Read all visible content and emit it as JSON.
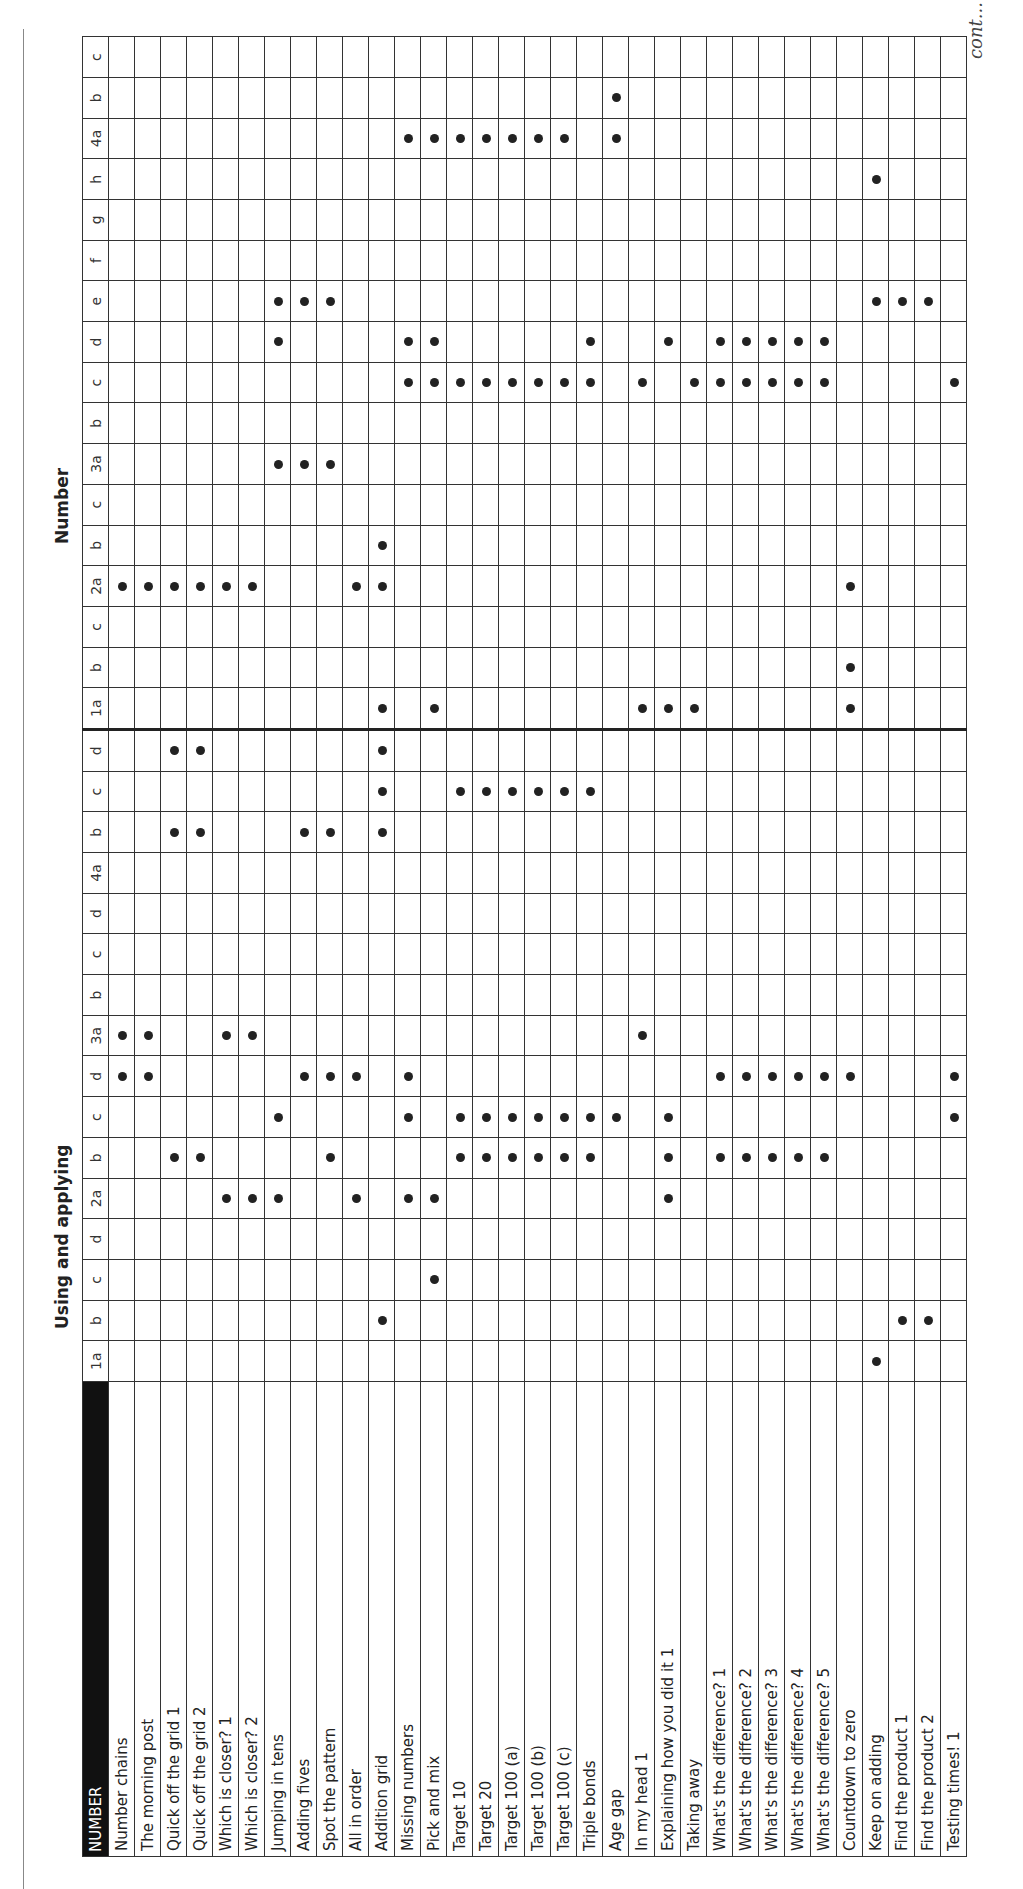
{
  "header": {
    "corner_label": "NUMBER",
    "sections": [
      {
        "title": "Using and applying",
        "criteria": [
          "1a",
          "b",
          "c",
          "d",
          "2a",
          "b",
          "c",
          "d",
          "3a",
          "b",
          "c",
          "d",
          "4a",
          "b",
          "c",
          "d"
        ]
      },
      {
        "title": "Number",
        "criteria": [
          "1a",
          "b",
          "c",
          "2a",
          "b",
          "c",
          "3a",
          "b",
          "c",
          "d",
          "e",
          "f",
          "g",
          "h",
          "4a",
          "b",
          "c"
        ]
      }
    ]
  },
  "footer": {
    "continued": "cont..."
  },
  "activities": [
    "Number chains",
    "The morning post",
    "Quick off the grid 1",
    "Quick off the grid 2",
    "Which is closer? 1",
    "Which is closer? 2",
    "Jumping in tens",
    "Adding fives",
    "Spot the pattern",
    "All in order",
    "Addition grid",
    "Missing numbers",
    "Pick and mix",
    "Target 10",
    "Target 20",
    "Target 100 (a)",
    "Target 100 (b)",
    "Target 100 (c)",
    "Triple bonds",
    "Age gap",
    "In my head 1",
    "Explaining how you did it 1",
    "Taking away",
    "What's the difference? 1",
    "What's the difference? 2",
    "What's the difference? 3",
    "What's the difference? 4",
    "What's the difference? 5",
    "Countdown to zero",
    "Keep on adding",
    "Find the product 1",
    "Find the product 2",
    "Testing times! 1"
  ],
  "marks": {
    "using_and_applying": {
      "1a": [
        29
      ],
      "1b": [
        10,
        30,
        31
      ],
      "1c": [
        12
      ],
      "1d": [],
      "2a": [
        4,
        5,
        6,
        9,
        11,
        12,
        21
      ],
      "2b": [
        2,
        3,
        8,
        13,
        14,
        15,
        16,
        17,
        18,
        21,
        23,
        24,
        25,
        26,
        27
      ],
      "2c": [
        6,
        11,
        13,
        14,
        15,
        16,
        17,
        18,
        19,
        21,
        32
      ],
      "2d": [
        0,
        1,
        7,
        8,
        9,
        11,
        23,
        24,
        25,
        26,
        27,
        28,
        32
      ],
      "3a": [
        0,
        1,
        4,
        5,
        20
      ],
      "3b": [],
      "3c": [],
      "3d": [],
      "4a": [],
      "4b": [
        2,
        3,
        7,
        8,
        10
      ],
      "4c": [
        10,
        13,
        14,
        15,
        16,
        17,
        18
      ],
      "4d": [
        2,
        3,
        10
      ]
    },
    "number": {
      "1a": [
        10,
        12,
        20,
        21,
        22,
        28
      ],
      "1b": [
        28
      ],
      "1c": [],
      "2a": [
        0,
        1,
        2,
        3,
        4,
        5,
        9,
        10,
        28
      ],
      "2b": [
        10
      ],
      "2c": [],
      "3a": [
        6,
        7,
        8
      ],
      "3b": [],
      "3c": [
        11,
        12,
        13,
        14,
        15,
        16,
        17,
        18,
        20,
        22,
        23,
        24,
        25,
        26,
        27,
        32
      ],
      "3d": [
        6,
        11,
        12,
        18,
        21,
        23,
        24,
        25,
        26,
        27
      ],
      "3e": [
        6,
        7,
        8,
        29,
        30,
        31
      ],
      "3f": [],
      "3g": [],
      "3h": [
        29
      ],
      "4a": [
        11,
        12,
        13,
        14,
        15,
        16,
        17,
        19
      ],
      "4b": [
        19
      ],
      "4c": []
    }
  },
  "colors": {
    "ink": "#222222",
    "header_bg": "#111111",
    "header_fg": "#ffffff"
  }
}
